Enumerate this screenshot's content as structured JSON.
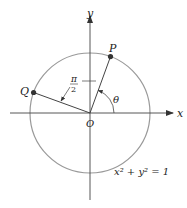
{
  "diagram": {
    "title": "",
    "labels": {
      "x_axis": "x",
      "y_axis": "y",
      "origin": "O",
      "point_p": "P",
      "point_q": "Q",
      "angle_theta": "θ",
      "angle_right_num": "π",
      "angle_right_den": "2",
      "equation": "x² + y² = 1"
    },
    "colors": {
      "circle": "#999999",
      "axes": "#444444",
      "points": "#333333"
    },
    "geometry": {
      "origin": [
        90,
        113
      ],
      "radius": 60,
      "p_angle_deg": 70,
      "q_angle_deg": 160
    }
  }
}
